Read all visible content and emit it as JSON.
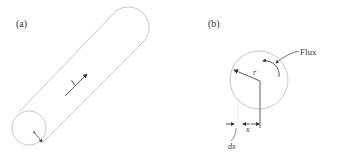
{
  "panels": [
    {
      "label": "(a)",
      "description": "Cylindrical conductor carrying current",
      "current_label": "I",
      "radius_label": "r"
    },
    {
      "label": "(b)",
      "description": "Cross-section showing flux and differential element",
      "radius_label": "r",
      "flux_label": "Flux",
      "x_label": "x",
      "dx_label": "dx"
    }
  ],
  "colors": {
    "outline": "#c8c8c8",
    "ink": "#333333"
  }
}
